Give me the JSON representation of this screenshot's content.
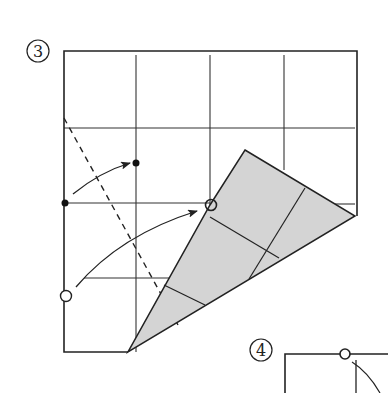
{
  "steps": [
    {
      "number": "3",
      "label": "③"
    },
    {
      "number": "4",
      "label": "④"
    }
  ],
  "colors": {
    "line": "#222222",
    "paper": "#ffffff",
    "flap_fill": "#d4d4d4"
  }
}
